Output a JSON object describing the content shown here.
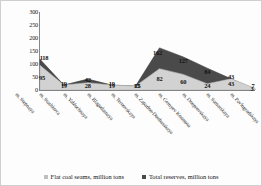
{
  "chart_data": {
    "type": "area",
    "title": "",
    "subtitle": "",
    "xlabel": "",
    "ylabel": "",
    "grid": false,
    "legend_position": "bottom",
    "ylim": [
      0,
      300
    ],
    "yticks": [
      300,
      250,
      200,
      150,
      100,
      50,
      0
    ],
    "categories": [
      "m. Stepnaya",
      "m. Stashkova",
      "m. Yablochnaya",
      "m. Blagodatnaya",
      "m. Ternovskaya",
      "m. Zapadno-Donbasskaya",
      "m. Geroyev Kosmosa",
      "m. Dneprovskaya",
      "m. Samarskaya",
      "m. Pavlogradskaya"
    ],
    "series": [
      {
        "name": "Flat coal seams, million tons",
        "color": "#d2d2d2",
        "values": [
          95,
          19,
          28,
          19,
          15,
          82,
          60,
          24,
          43,
          7
        ]
      },
      {
        "name": "Total reserves, million tons",
        "color": "#4a4a4a",
        "values": [
          118,
          19,
          42,
          19,
          15,
          162,
          127,
          84,
          43,
          3
        ]
      }
    ]
  },
  "legend": {
    "items": [
      {
        "label": "Flat coal seams, million tons",
        "color": "#bfbfbf"
      },
      {
        "label": "Total reserves, million tons",
        "color": "#4a4a4a"
      }
    ]
  },
  "axis": {
    "y_tick_labels": [
      "300",
      "250",
      "200",
      "150",
      "100",
      "50",
      "0"
    ]
  },
  "value_labels": {
    "flat": [
      "95",
      "19",
      "28",
      "19",
      "15",
      "82",
      "60",
      "24",
      "43",
      "7"
    ],
    "total": [
      "118",
      "19",
      "42",
      "19",
      "15",
      "162",
      "127",
      "84",
      "43",
      "3"
    ]
  }
}
